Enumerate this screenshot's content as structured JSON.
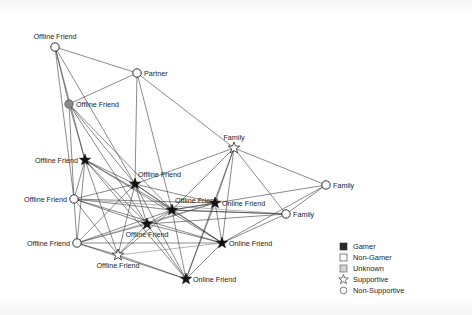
{
  "chart_data": {
    "type": "diagram",
    "subtype": "social-network-graph",
    "title": "",
    "background_color": "#ffffff",
    "edge_color": "#2a2a2a",
    "nodes": [
      {
        "id": "n1",
        "label": "Offline Friend",
        "x": 55,
        "y": 47,
        "shape": "circle",
        "fill": "open",
        "label_pos": "above",
        "gamer": "Non-Gamer",
        "support": "Non-Supportive"
      },
      {
        "id": "n2",
        "label": "Partner",
        "x": 137,
        "y": 73,
        "shape": "circle",
        "fill": "open",
        "label_pos": "right",
        "gamer": "Non-Gamer",
        "support": "Non-Supportive"
      },
      {
        "id": "n3",
        "label": "Offline Friend",
        "x": 69,
        "y": 104,
        "shape": "circle",
        "fill": "gray",
        "label_pos": "right",
        "gamer": "Unknown",
        "support": "Non-Supportive"
      },
      {
        "id": "n4",
        "label": "Family",
        "x": 234,
        "y": 148,
        "shape": "star",
        "fill": "open",
        "label_pos": "above",
        "gamer": "Non-Gamer",
        "support": "Supportive"
      },
      {
        "id": "n5",
        "label": "Offline Friend",
        "x": 85,
        "y": 160,
        "shape": "star",
        "fill": "filled",
        "label_pos": "left",
        "gamer": "Gamer",
        "support": "Supportive"
      },
      {
        "id": "n6",
        "label": "Offline Friend",
        "x": 135,
        "y": 184,
        "shape": "star",
        "fill": "filled",
        "label_pos": "above-right",
        "gamer": "Gamer",
        "support": "Supportive"
      },
      {
        "id": "n7",
        "label": "Family",
        "x": 326,
        "y": 185,
        "shape": "circle",
        "fill": "open",
        "label_pos": "right",
        "gamer": "Non-Gamer",
        "support": "Non-Supportive"
      },
      {
        "id": "n8",
        "label": "Offline Friend",
        "x": 74,
        "y": 199,
        "shape": "circle",
        "fill": "open",
        "label_pos": "left",
        "gamer": "Non-Gamer",
        "support": "Non-Supportive"
      },
      {
        "id": "n9",
        "label": "Offline Friend",
        "x": 172,
        "y": 210,
        "shape": "star",
        "fill": "filled",
        "label_pos": "above-right",
        "gamer": "Gamer",
        "support": "Supportive"
      },
      {
        "id": "n10",
        "label": "Online Friend",
        "x": 215,
        "y": 203,
        "shape": "star",
        "fill": "filled",
        "label_pos": "right",
        "gamer": "Gamer",
        "support": "Supportive"
      },
      {
        "id": "n11",
        "label": "Family",
        "x": 286,
        "y": 214,
        "shape": "circle",
        "fill": "open",
        "label_pos": "right",
        "gamer": "Non-Gamer",
        "support": "Non-Supportive"
      },
      {
        "id": "n12",
        "label": "Offline Friend",
        "x": 147,
        "y": 224,
        "shape": "star",
        "fill": "filled",
        "label_pos": "below",
        "gamer": "Gamer",
        "support": "Supportive"
      },
      {
        "id": "n13",
        "label": "Offline Friend",
        "x": 77,
        "y": 243,
        "shape": "circle",
        "fill": "open",
        "label_pos": "left",
        "gamer": "Non-Gamer",
        "support": "Non-Supportive"
      },
      {
        "id": "n14",
        "label": "Online Friend",
        "x": 222,
        "y": 243,
        "shape": "star",
        "fill": "filled",
        "label_pos": "right",
        "gamer": "Gamer",
        "support": "Supportive"
      },
      {
        "id": "n15",
        "label": "Offline Friend",
        "x": 118,
        "y": 255,
        "shape": "star",
        "fill": "open",
        "label_pos": "below",
        "gamer": "Non-Gamer",
        "support": "Supportive"
      },
      {
        "id": "n16",
        "label": "Online Friend",
        "x": 186,
        "y": 279,
        "shape": "star",
        "fill": "filled",
        "label_pos": "right",
        "gamer": "Gamer",
        "support": "Supportive"
      }
    ],
    "edges": [
      [
        "n1",
        "n2"
      ],
      [
        "n1",
        "n3"
      ],
      [
        "n1",
        "n5"
      ],
      [
        "n1",
        "n6"
      ],
      [
        "n1",
        "n8"
      ],
      [
        "n2",
        "n3"
      ],
      [
        "n2",
        "n4"
      ],
      [
        "n2",
        "n6"
      ],
      [
        "n2",
        "n9"
      ],
      [
        "n3",
        "n5"
      ],
      [
        "n3",
        "n6"
      ],
      [
        "n3",
        "n8"
      ],
      [
        "n3",
        "n9"
      ],
      [
        "n3",
        "n12"
      ],
      [
        "n4",
        "n6"
      ],
      [
        "n4",
        "n7"
      ],
      [
        "n4",
        "n9"
      ],
      [
        "n4",
        "n10"
      ],
      [
        "n4",
        "n11"
      ],
      [
        "n4",
        "n14"
      ],
      [
        "n4",
        "n16"
      ],
      [
        "n5",
        "n6"
      ],
      [
        "n5",
        "n8"
      ],
      [
        "n5",
        "n9"
      ],
      [
        "n5",
        "n12"
      ],
      [
        "n5",
        "n13"
      ],
      [
        "n5",
        "n14"
      ],
      [
        "n5",
        "n15"
      ],
      [
        "n5",
        "n16"
      ],
      [
        "n6",
        "n8"
      ],
      [
        "n6",
        "n9"
      ],
      [
        "n6",
        "n10"
      ],
      [
        "n6",
        "n12"
      ],
      [
        "n6",
        "n13"
      ],
      [
        "n6",
        "n14"
      ],
      [
        "n6",
        "n15"
      ],
      [
        "n6",
        "n16"
      ],
      [
        "n7",
        "n11"
      ],
      [
        "n7",
        "n9"
      ],
      [
        "n7",
        "n14"
      ],
      [
        "n8",
        "n9"
      ],
      [
        "n8",
        "n10"
      ],
      [
        "n8",
        "n12"
      ],
      [
        "n8",
        "n13"
      ],
      [
        "n8",
        "n14"
      ],
      [
        "n8",
        "n15"
      ],
      [
        "n9",
        "n10"
      ],
      [
        "n9",
        "n11"
      ],
      [
        "n9",
        "n12"
      ],
      [
        "n9",
        "n13"
      ],
      [
        "n9",
        "n14"
      ],
      [
        "n9",
        "n15"
      ],
      [
        "n9",
        "n16"
      ],
      [
        "n10",
        "n12"
      ],
      [
        "n10",
        "n14"
      ],
      [
        "n10",
        "n16"
      ],
      [
        "n11",
        "n9"
      ],
      [
        "n11",
        "n14"
      ],
      [
        "n11",
        "n12"
      ],
      [
        "n12",
        "n13"
      ],
      [
        "n12",
        "n14"
      ],
      [
        "n12",
        "n15"
      ],
      [
        "n12",
        "n16"
      ],
      [
        "n13",
        "n14"
      ],
      [
        "n13",
        "n15"
      ],
      [
        "n13",
        "n16"
      ],
      [
        "n14",
        "n16"
      ],
      [
        "n15",
        "n16"
      ]
    ],
    "edges_light": [
      [
        "n8",
        "n11"
      ],
      [
        "n13",
        "n10"
      ],
      [
        "n15",
        "n14"
      ]
    ]
  },
  "legend": {
    "title": "",
    "x": 340,
    "y": 247,
    "row_height": 11,
    "items": [
      {
        "label": "Gamer",
        "symbol": "filled-square"
      },
      {
        "label": "Non-Gamer",
        "symbol": "open-square"
      },
      {
        "label": "Unknown",
        "symbol": "gray-square"
      },
      {
        "label": "Supportive",
        "symbol": "open-star"
      },
      {
        "label": "Non-Supportive",
        "symbol": "open-circle"
      }
    ]
  }
}
